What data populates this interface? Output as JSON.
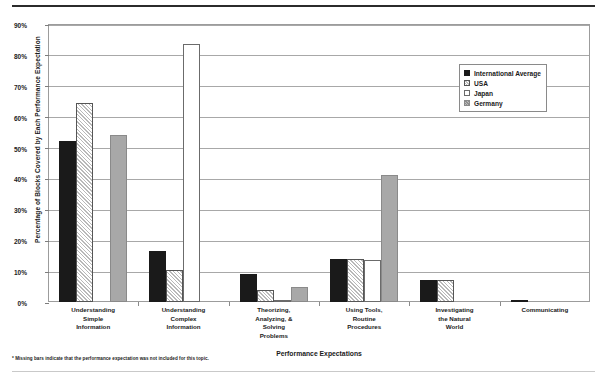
{
  "footnote": "* Missing bars indicate that the performance expectation was not included for this topic.",
  "legend": {
    "items": [
      {
        "label": "International Average",
        "swatch": "black-solid-swatch"
      },
      {
        "label": "USA",
        "swatch": "white-hatched-swatch"
      },
      {
        "label": "Japan",
        "swatch": "white-outline-swatch"
      },
      {
        "label": "Germany",
        "swatch": "gray-solid-swatch"
      }
    ]
  },
  "chart_data": {
    "type": "bar",
    "title": "",
    "xlabel": "Performance Expectations",
    "ylabel": "Percentage of Blocks Covered by Each Performance Expectation",
    "ylim": [
      0,
      90
    ],
    "ytick_labels": [
      "0%",
      "10%",
      "20%",
      "30%",
      "40%",
      "50%",
      "60%",
      "70%",
      "80%",
      "90%"
    ],
    "ytick_values": [
      0,
      10,
      20,
      30,
      40,
      50,
      60,
      70,
      80,
      90
    ],
    "grid": true,
    "legend_position": "top-right",
    "categories": [
      "Understanding Simple Information",
      "Understanding Complex Information",
      "Theorizing, Analyzing, & Solving Problems",
      "Using Tools, Routine Procedures",
      "Investigating the Natural World",
      "Communicating"
    ],
    "category_lines": [
      [
        "Understanding",
        "Simple",
        "Information"
      ],
      [
        "Understanding",
        "Complex",
        "Information"
      ],
      [
        "Theorizing,",
        "Analyzing, &",
        "Solving",
        "Problems"
      ],
      [
        "Using Tools,",
        "Routine",
        "Procedures"
      ],
      [
        "Investigating",
        "the Natural",
        "World"
      ],
      [
        "Communicating"
      ]
    ],
    "series": [
      {
        "name": "International Average",
        "values": [
          52,
          16.5,
          9,
          14,
          7,
          0.5
        ]
      },
      {
        "name": "USA",
        "values": [
          64.5,
          10.5,
          4,
          14,
          7,
          null
        ]
      },
      {
        "name": "Japan",
        "values": [
          null,
          83.5,
          0.5,
          13.5,
          null,
          null
        ]
      },
      {
        "name": "Germany",
        "values": [
          54,
          null,
          5,
          41,
          null,
          null
        ]
      }
    ]
  }
}
